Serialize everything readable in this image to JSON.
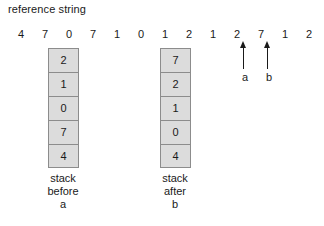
{
  "diagram": {
    "title": "reference string",
    "reference_string": {
      "values": [
        "4",
        "7",
        "0",
        "7",
        "1",
        "0",
        "1",
        "2",
        "1",
        "2",
        "7",
        "1",
        "2"
      ],
      "start_x": 14,
      "spacing": 24,
      "top": 27
    },
    "stacks": [
      {
        "name": "stack-before-a",
        "left": 48,
        "top": 48,
        "cells": [
          "2",
          "1",
          "0",
          "7",
          "4"
        ],
        "caption_lines": [
          "stack",
          "before",
          "a"
        ],
        "caption_left": 18,
        "caption_top": 172
      },
      {
        "name": "stack-after-b",
        "left": 160,
        "top": 48,
        "cells": [
          "7",
          "2",
          "1",
          "0",
          "4"
        ],
        "caption_lines": [
          "stack",
          "after",
          "b"
        ],
        "caption_left": 130,
        "caption_top": 172
      }
    ],
    "arrows": [
      {
        "name": "arrow-a",
        "label": "a",
        "points_to_value": "2",
        "points_to_index": 9,
        "left": 238,
        "top": 41,
        "label_left": 238,
        "label_top": 71
      },
      {
        "name": "arrow-b",
        "label": "b",
        "points_to_value": "7",
        "points_to_index": 10,
        "left": 262,
        "top": 41,
        "label_left": 262,
        "label_top": 71
      }
    ],
    "colors": {
      "background": "#ffffff",
      "cell_fill": "#dcdcdc",
      "cell_border": "#8c8c8c",
      "text": "#1a1a1a"
    }
  }
}
